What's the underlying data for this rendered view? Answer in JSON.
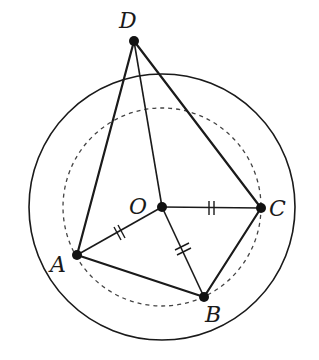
{
  "diagram": {
    "type": "geometry",
    "points": {
      "D": {
        "label": "D",
        "x": 134,
        "y": 41,
        "label_x": 118,
        "label_y": 27
      },
      "O": {
        "label": "O",
        "x": 162,
        "y": 207,
        "label_x": 128,
        "label_y": 205
      },
      "C": {
        "label": "C",
        "x": 261,
        "y": 208,
        "label_x": 270,
        "label_y": 217
      },
      "A": {
        "label": "A",
        "x": 77,
        "y": 255,
        "label_x": 50,
        "label_y": 270
      },
      "B": {
        "label": "B",
        "x": 204,
        "y": 297,
        "label_x": 204,
        "label_y": 322
      }
    },
    "circles": [
      {
        "name": "outer-circle",
        "cx": 162,
        "cy": 207,
        "r": 133,
        "style": "solid"
      },
      {
        "name": "inner-circle",
        "cx": 162,
        "cy": 207,
        "r": 99,
        "style": "dashed"
      }
    ],
    "segments": [
      [
        "D",
        "A"
      ],
      [
        "D",
        "O"
      ],
      [
        "D",
        "C"
      ],
      [
        "O",
        "A"
      ],
      [
        "O",
        "B"
      ],
      [
        "O",
        "C"
      ],
      [
        "A",
        "B"
      ],
      [
        "B",
        "C"
      ]
    ],
    "equal_marks": [
      "OA",
      "OB",
      "OC"
    ],
    "colors": {
      "ink": "#1a1a1a",
      "background": "#ffffff"
    }
  }
}
